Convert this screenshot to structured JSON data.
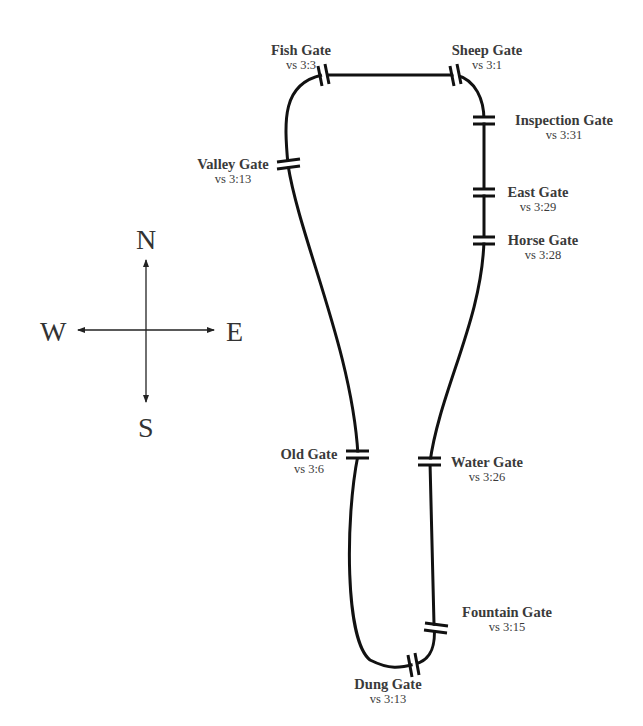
{
  "diagram": {
    "line_color": "#111111",
    "text_color": "#3a3a3a"
  },
  "compass": {
    "north": "N",
    "south": "S",
    "east": "E",
    "west": "W"
  },
  "gates": [
    {
      "name": "Fish Gate",
      "ref": "vs 3:3"
    },
    {
      "name": "Sheep Gate",
      "ref": "vs 3:1"
    },
    {
      "name": "Inspection Gate",
      "ref": "vs 3:31"
    },
    {
      "name": "Valley Gate",
      "ref": "vs 3:13"
    },
    {
      "name": "East Gate",
      "ref": "vs 3:29"
    },
    {
      "name": "Horse Gate",
      "ref": "vs 3:28"
    },
    {
      "name": "Old Gate",
      "ref": "vs 3:6"
    },
    {
      "name": "Water Gate",
      "ref": "vs 3:26"
    },
    {
      "name": "Fountain Gate",
      "ref": "vs 3:15"
    },
    {
      "name": "Dung Gate",
      "ref": "vs 3:13"
    }
  ]
}
